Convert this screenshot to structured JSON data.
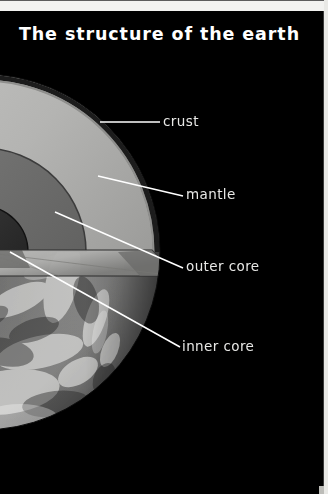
{
  "poster": {
    "title": "The structure of the earth",
    "background_color": "#000000",
    "border_color": "#f2f2f0",
    "title_color": "#ffffff",
    "label_color": "#e8e8e6",
    "leader_line_color": "#ffffff"
  },
  "diagram": {
    "description_alt": "Photograph of the Earth from space with a cutaway wedge revealing its internal layers",
    "layers": [
      {
        "key": "crust",
        "label": "crust",
        "fill": "#2a2a2a",
        "order": 1
      },
      {
        "key": "mantle",
        "label": "mantle",
        "fill": "#b9b9b7",
        "order": 2
      },
      {
        "key": "outer_core",
        "label": "outer core",
        "fill": "#6f6f6e",
        "order": 3
      },
      {
        "key": "inner_core",
        "label": "inner core",
        "fill": "#2f2f2f",
        "order": 4
      }
    ]
  },
  "labels": {
    "crust": "crust",
    "mantle": "mantle",
    "outer_core": "outer core",
    "inner_core": "inner core"
  }
}
